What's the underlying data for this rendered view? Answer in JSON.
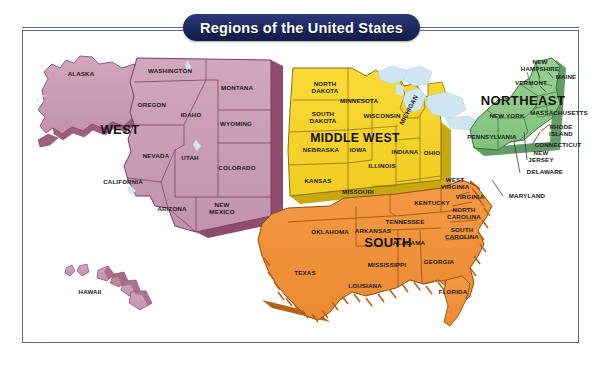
{
  "figure": {
    "title": "Regions of the United States",
    "frame_color": "#5c6689",
    "background": "#ffffff"
  },
  "chart_data": {
    "type": "map",
    "title": "Regions of the United States",
    "subtitle": "",
    "projection": "contiguous United States with Alaska and Hawaii insets",
    "legend_position": "none",
    "regions": [
      {
        "name": "WEST",
        "color": "#c99ab4",
        "outline": "#7a3d60",
        "label_x": 120,
        "label_y": 130,
        "states": [
          "WASHINGTON",
          "OREGON",
          "IDAHO",
          "MONTANA",
          "WYOMING",
          "NEVADA",
          "UTAH",
          "COLORADO",
          "CALIFORNIA",
          "ARIZONA",
          "NEW MEXICO",
          "ALASKA",
          "HAWAII"
        ]
      },
      {
        "name": "MIDDLE WEST",
        "color": "#f6d42e",
        "outline": "#8a6f14",
        "label_x": 355,
        "label_y": 138,
        "states": [
          "NORTH DAKOTA",
          "SOUTH DAKOTA",
          "MINNESOTA",
          "WISCONSIN",
          "MICHIGAN",
          "NEBRASKA",
          "IOWA",
          "ILLINOIS",
          "INDIANA",
          "OHIO",
          "KANSAS",
          "MISSOURI"
        ]
      },
      {
        "name": "SOUTH",
        "color": "#f0903a",
        "outline": "#8d4d14",
        "label_x": 388,
        "label_y": 243,
        "states": [
          "OKLAHOMA",
          "ARKANSAS",
          "TEXAS",
          "LOUSIANA",
          "MISSISSIPPI",
          "ALABAMA",
          "TENNESSEE",
          "KENTUCKY",
          "GEORGIA",
          "FLORIDA",
          "SOUTH CAROLINA",
          "NORTH CAROLINA",
          "VIRGINIA",
          "WEST VIRGINIA",
          "MARYLAND"
        ]
      },
      {
        "name": "NORTHEAST",
        "color": "#8fc98c",
        "outline": "#2f7a33",
        "label_x": 523,
        "label_y": 101,
        "states": [
          "MAINE",
          "NEW HAMPSHIRE",
          "VERMONT",
          "NEW YORK",
          "MASSACHUSETTS",
          "RHODE ISLAND",
          "CONNECTICUT",
          "PENNSYLVANIA",
          "NEW JERSEY",
          "DELAWARE"
        ]
      }
    ],
    "water": {
      "name": "Great Lakes",
      "color": "#cfe6f2"
    },
    "state_labels": [
      {
        "text": "ALASKA",
        "x": 81,
        "y": 74,
        "lines": [
          "ALASKA"
        ]
      },
      {
        "text": "HAWAII",
        "x": 90,
        "y": 292,
        "lines": [
          "HAWAII"
        ]
      },
      {
        "text": "WASHINGTON",
        "x": 170,
        "y": 71,
        "lines": [
          "WASHINGTON"
        ]
      },
      {
        "text": "OREGON",
        "x": 152,
        "y": 105,
        "lines": [
          "OREGON"
        ]
      },
      {
        "text": "IDAHO",
        "x": 191,
        "y": 115,
        "lines": [
          "IDAHO"
        ]
      },
      {
        "text": "MONTANA",
        "x": 237,
        "y": 88,
        "lines": [
          "MONTANA"
        ]
      },
      {
        "text": "WYOMING",
        "x": 236,
        "y": 124,
        "lines": [
          "WYOMING"
        ]
      },
      {
        "text": "NEVADA",
        "x": 156,
        "y": 156,
        "lines": [
          "NEVADA"
        ]
      },
      {
        "text": "UTAH",
        "x": 190,
        "y": 158,
        "lines": [
          "UTAH"
        ]
      },
      {
        "text": "COLORADO",
        "x": 237,
        "y": 168,
        "lines": [
          "COLORADO"
        ]
      },
      {
        "text": "CALIFORNIA",
        "x": 123,
        "y": 182,
        "lines": [
          "CALIFORNIA"
        ]
      },
      {
        "text": "ARIZONA",
        "x": 172,
        "y": 209,
        "lines": [
          "ARIZONA"
        ]
      },
      {
        "text": "NEW MEXICO",
        "x": 222,
        "y": 209,
        "lines": [
          "NEW",
          "MEXICO"
        ]
      },
      {
        "text": "NORTH DAKOTA",
        "x": 325,
        "y": 88,
        "lines": [
          "NORTH",
          "DAKOTA"
        ]
      },
      {
        "text": "SOUTH DAKOTA",
        "x": 323,
        "y": 118,
        "lines": [
          "SOUTH",
          "DAKOTA"
        ]
      },
      {
        "text": "MINNESOTA",
        "x": 359,
        "y": 101,
        "lines": [
          "MINNESOTA"
        ]
      },
      {
        "text": "WISCONSIN",
        "x": 382,
        "y": 116,
        "lines": [
          "WISCONSIN"
        ]
      },
      {
        "text": "MICHIGAN",
        "x": 409,
        "y": 110,
        "lines": [
          "MICHIGAN"
        ],
        "rotate": -62
      },
      {
        "text": "NEBRASKA",
        "x": 321,
        "y": 150,
        "lines": [
          "NEBRASKA"
        ]
      },
      {
        "text": "IOWA",
        "x": 358,
        "y": 150,
        "lines": [
          "IOWA"
        ]
      },
      {
        "text": "ILLINOIS",
        "x": 382,
        "y": 166,
        "lines": [
          "ILLINOIS"
        ]
      },
      {
        "text": "INDIANA",
        "x": 405,
        "y": 152,
        "lines": [
          "INDIANA"
        ]
      },
      {
        "text": "OHIO",
        "x": 432,
        "y": 153,
        "lines": [
          "OHIO"
        ]
      },
      {
        "text": "KANSAS",
        "x": 318,
        "y": 181,
        "lines": [
          "KANSAS"
        ]
      },
      {
        "text": "MISSOURI",
        "x": 358,
        "y": 192,
        "lines": [
          "MISSOURI"
        ]
      },
      {
        "text": "OKLAHOMA",
        "x": 330,
        "y": 232,
        "lines": [
          "OKLAHOMA"
        ]
      },
      {
        "text": "ARKANSAS",
        "x": 373,
        "y": 231,
        "lines": [
          "ARKANSAS"
        ]
      },
      {
        "text": "TEXAS",
        "x": 305,
        "y": 273,
        "lines": [
          "TEXAS"
        ]
      },
      {
        "text": "LOUSIANA",
        "x": 365,
        "y": 286,
        "lines": [
          "LOUSIANA"
        ]
      },
      {
        "text": "MISSISSIPPI",
        "x": 387,
        "y": 265,
        "lines": [
          "MISSISSIPPI"
        ]
      },
      {
        "text": "ALABAMA",
        "x": 409,
        "y": 243,
        "lines": [
          "ALABAMA"
        ]
      },
      {
        "text": "TENNESSEE",
        "x": 405,
        "y": 222,
        "lines": [
          "TENNESSEE"
        ]
      },
      {
        "text": "KENTUCKY",
        "x": 432,
        "y": 203,
        "lines": [
          "KENTUCKY"
        ]
      },
      {
        "text": "GEORGIA",
        "x": 439,
        "y": 262,
        "lines": [
          "GEORGIA"
        ]
      },
      {
        "text": "FLORIDA",
        "x": 453,
        "y": 292,
        "lines": [
          "FLORIDA"
        ]
      },
      {
        "text": "SOUTH CAROLINA",
        "x": 462,
        "y": 234,
        "lines": [
          "SOUTH",
          "CAROLINA"
        ]
      },
      {
        "text": "NORTH CAROLINA",
        "x": 464,
        "y": 214,
        "lines": [
          "NORTH",
          "CAROLINA"
        ]
      },
      {
        "text": "VIRGINIA",
        "x": 470,
        "y": 197,
        "lines": [
          "VIRGINIA"
        ]
      },
      {
        "text": "WEST VIRGINIA",
        "x": 455,
        "y": 184,
        "lines": [
          "WEST",
          "VIRGINIA"
        ]
      },
      {
        "text": "MARYLAND",
        "x": 527,
        "y": 196,
        "lines": [
          "MARYLAND"
        ]
      },
      {
        "text": "NEW HAMPSHIRE",
        "x": 540,
        "y": 66,
        "lines": [
          "NEW",
          "HAMPSHIRE"
        ]
      },
      {
        "text": "VERMONT",
        "x": 531,
        "y": 83,
        "lines": [
          "VERMONT"
        ]
      },
      {
        "text": "MAINE",
        "x": 566,
        "y": 77,
        "lines": [
          "MAINE"
        ]
      },
      {
        "text": "NEW YORK",
        "x": 507,
        "y": 116,
        "lines": [
          "NEW YORK"
        ]
      },
      {
        "text": "MASSACHUSETTS",
        "x": 559,
        "y": 113,
        "lines": [
          "MASSACHUSETTS"
        ]
      },
      {
        "text": "RHODE ISLAND",
        "x": 561,
        "y": 131,
        "lines": [
          "RHODE",
          "ISLAND"
        ]
      },
      {
        "text": "CONNECTICUT",
        "x": 558,
        "y": 145,
        "lines": [
          "CONNECTICUT"
        ]
      },
      {
        "text": "PENNSYLVANIA",
        "x": 492,
        "y": 137,
        "lines": [
          "PENNSYLVANIA"
        ]
      },
      {
        "text": "NEW JERSEY",
        "x": 541,
        "y": 157,
        "lines": [
          "NEW",
          "JERSEY"
        ]
      },
      {
        "text": "DELAWARE",
        "x": 545,
        "y": 172,
        "lines": [
          "DELAWARE"
        ]
      }
    ]
  }
}
